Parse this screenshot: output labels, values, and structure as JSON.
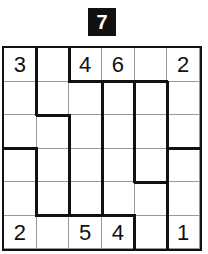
{
  "puzzle": {
    "badge_number": "7",
    "rows": 6,
    "cols": 6,
    "cells": [
      [
        "3",
        "",
        "4",
        "6",
        "",
        "2"
      ],
      [
        "",
        "",
        "",
        "",
        "",
        ""
      ],
      [
        "",
        "",
        "",
        "",
        "",
        ""
      ],
      [
        "",
        "",
        "",
        "",
        "",
        ""
      ],
      [
        "",
        "",
        "",
        "",
        "",
        ""
      ],
      [
        "2",
        "",
        "5",
        "4",
        "",
        "1"
      ]
    ]
  },
  "colors": {
    "line": "#111111",
    "thin_line": "#999999",
    "background": "#ffffff"
  }
}
